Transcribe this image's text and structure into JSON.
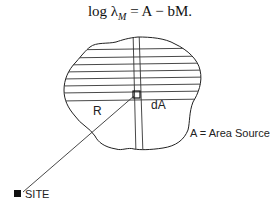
{
  "equation": {
    "prefix": "log λ",
    "subscript": "M",
    "rhs": " = A − bM."
  },
  "labels": {
    "radius": "R",
    "element": "dA",
    "area_source": "A = Area Source",
    "site": "SITE"
  },
  "colors": {
    "stroke": "#222222",
    "site_marker": "#111111"
  }
}
